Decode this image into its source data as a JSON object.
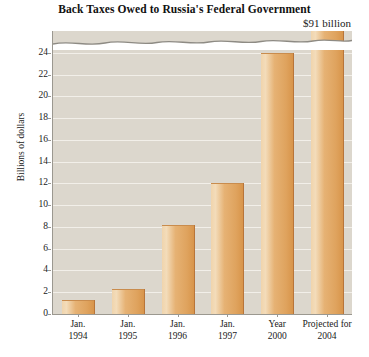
{
  "chart_data": {
    "type": "bar",
    "title": "Back Taxes Owed to Russia's Federal Government",
    "xlabel": "",
    "ylabel": "Billions of dollars",
    "categories": [
      "Jan. 1994",
      "Jan. 1995",
      "Jan. 1996",
      "Jan. 1997",
      "Year 2000",
      "Projected for 2004"
    ],
    "category_lines": [
      {
        "line1": "Jan.",
        "line2": "1994"
      },
      {
        "line1": "Jan.",
        "line2": "1995"
      },
      {
        "line1": "Jan.",
        "line2": "1996"
      },
      {
        "line1": "Jan.",
        "line2": "1997"
      },
      {
        "line1": "Year",
        "line2": "2000"
      },
      {
        "line1": "Projected for",
        "line2": "2004"
      }
    ],
    "values": [
      1.3,
      2.3,
      8.2,
      12.0,
      24.0,
      91.0
    ],
    "ylim": [
      0,
      26
    ],
    "yticks": [
      0,
      2,
      4,
      6,
      8,
      10,
      12,
      14,
      16,
      18,
      20,
      22,
      24
    ],
    "ytick_labels": [
      "0",
      "2",
      "4",
      "6",
      "8",
      "10",
      "12",
      "14",
      "16",
      "18",
      "20",
      "22",
      "24"
    ],
    "grid": true,
    "legend": false,
    "axis_break": {
      "present": true,
      "style": "wavy",
      "note": "y-axis is broken near the top; the final bar extends through the break"
    },
    "annotations": [
      {
        "text": "$91 billion",
        "attached_to": "Projected for 2004",
        "position": "above-bar"
      }
    ],
    "colors": {
      "bar_fill": "#e0a865",
      "bar_highlight": "#f3dcba",
      "bar_edge": "#b8753a",
      "plot_background": "#dcd7cd",
      "gridline": "#f2efe9",
      "axis": "#9b9890",
      "text": "#1a1a1a",
      "page_background": "#ffffff"
    }
  }
}
